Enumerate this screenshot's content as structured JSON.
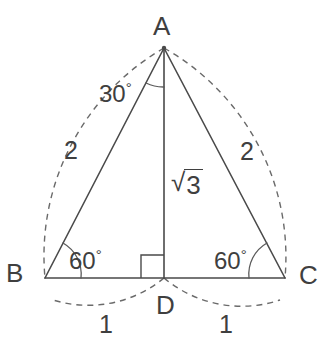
{
  "figure": {
    "vertices": {
      "a": "A",
      "b": "B",
      "c": "C",
      "d": "D"
    },
    "angles": {
      "apex": "30",
      "apex_degree_symbol": "°",
      "base_left": "60",
      "base_left_degree_symbol": "°",
      "base_right": "60",
      "base_right_degree_symbol": "°"
    },
    "side_labels": {
      "left_hypotenuse": "2",
      "right_hypotenuse": "2",
      "altitude_radical": "√",
      "altitude_radicand": "3",
      "base_left_half": "1",
      "base_right_half": "1"
    },
    "colors": {
      "background": "#ffffff",
      "solid_line": "#4a4a4a",
      "dashed_line": "#6a6a6a",
      "text": "#3f3f3f"
    },
    "geometry": {
      "point_a": [
        164,
        48
      ],
      "point_b": [
        45,
        278
      ],
      "point_c": [
        285,
        278
      ],
      "point_d": [
        164,
        278
      ]
    }
  }
}
